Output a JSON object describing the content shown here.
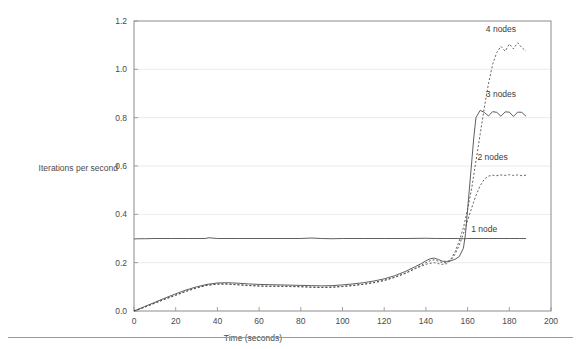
{
  "figure": {
    "width": 581,
    "height": 349,
    "background": "#ffffff",
    "footer_rule_color": "#9a9a9a"
  },
  "chart_data": {
    "type": "line",
    "title": "",
    "subtitle": "",
    "xlabel": "Time (seconds)",
    "ylabel": "Iterations per second",
    "xlim": [
      0,
      200
    ],
    "ylim": [
      0,
      1.2
    ],
    "xticks": [
      0,
      20,
      40,
      60,
      80,
      100,
      120,
      140,
      160,
      180,
      200
    ],
    "xtick_labels": [
      "0",
      "20",
      "40",
      "60",
      "80",
      "100",
      "120",
      "140",
      "160",
      "180",
      "200"
    ],
    "yticks": [
      0.0,
      0.2,
      0.4,
      0.6,
      0.8,
      1.0,
      1.2
    ],
    "ytick_labels": [
      "0.0",
      "0.2",
      "0.4",
      "0.6",
      "0.8",
      "1.0",
      "1.2"
    ],
    "grid": true,
    "grid_axis": "y",
    "grid_color": "#e6e6e6",
    "frame_color": "#8c8c8c",
    "legend_position": "inline-annotations",
    "line_color": "#4d4d4d",
    "annotations": [
      {
        "label": "4 nodes",
        "x": 176,
        "y": 1.155
      },
      {
        "label": "3 nodes",
        "x": 176,
        "y": 0.885
      },
      {
        "label": "2 nodes",
        "x": 172,
        "y": 0.625
      },
      {
        "label": "1 node",
        "x": 168,
        "y": 0.325
      }
    ],
    "series": [
      {
        "name": "1 node",
        "style": "solid",
        "dash": "none",
        "x": [
          0,
          2,
          5,
          10,
          18,
          26,
          34,
          36,
          40,
          50,
          60,
          70,
          80,
          85,
          90,
          95,
          100,
          110,
          120,
          130,
          140,
          145,
          150,
          155,
          158,
          160,
          165,
          170,
          175,
          180,
          185,
          188
        ],
        "y": [
          0.298,
          0.299,
          0.299,
          0.3,
          0.3,
          0.3,
          0.3,
          0.303,
          0.3,
          0.3,
          0.3,
          0.3,
          0.3,
          0.302,
          0.3,
          0.299,
          0.3,
          0.3,
          0.3,
          0.3,
          0.301,
          0.3,
          0.3,
          0.3,
          0.299,
          0.3,
          0.3,
          0.3,
          0.3,
          0.3,
          0.3,
          0.3
        ]
      },
      {
        "name": "2 nodes",
        "style": "dotted",
        "dash": "2,2",
        "x": [
          0,
          5,
          10,
          15,
          20,
          25,
          30,
          35,
          40,
          45,
          50,
          55,
          60,
          65,
          70,
          75,
          80,
          85,
          90,
          95,
          100,
          105,
          110,
          115,
          120,
          125,
          130,
          135,
          138,
          141,
          144,
          146,
          148,
          150,
          152,
          154,
          156,
          158,
          160,
          162,
          164,
          166,
          168,
          170,
          172,
          174,
          176,
          178,
          180,
          182,
          184,
          186,
          188
        ],
        "y": [
          0.0,
          0.016,
          0.033,
          0.05,
          0.066,
          0.082,
          0.096,
          0.107,
          0.112,
          0.112,
          0.109,
          0.106,
          0.104,
          0.103,
          0.103,
          0.102,
          0.101,
          0.099,
          0.098,
          0.099,
          0.102,
          0.106,
          0.111,
          0.118,
          0.127,
          0.14,
          0.155,
          0.175,
          0.186,
          0.196,
          0.2,
          0.196,
          0.193,
          0.196,
          0.21,
          0.235,
          0.272,
          0.32,
          0.374,
          0.428,
          0.478,
          0.518,
          0.545,
          0.558,
          0.562,
          0.56,
          0.563,
          0.561,
          0.564,
          0.561,
          0.563,
          0.56,
          0.562
        ]
      },
      {
        "name": "3 nodes",
        "style": "solid",
        "dash": "none",
        "x": [
          0,
          5,
          10,
          15,
          20,
          25,
          30,
          35,
          40,
          45,
          50,
          55,
          60,
          65,
          70,
          75,
          80,
          85,
          90,
          95,
          100,
          105,
          110,
          115,
          120,
          125,
          130,
          135,
          138,
          140,
          142,
          144,
          146,
          148,
          150,
          152,
          154,
          156,
          158,
          159,
          160,
          162,
          163,
          164,
          166,
          168,
          170,
          172,
          174,
          176,
          178,
          180,
          182,
          184,
          186,
          188
        ],
        "y": [
          0.0,
          0.018,
          0.036,
          0.054,
          0.071,
          0.087,
          0.1,
          0.11,
          0.116,
          0.117,
          0.115,
          0.112,
          0.11,
          0.109,
          0.108,
          0.107,
          0.106,
          0.105,
          0.104,
          0.105,
          0.108,
          0.112,
          0.117,
          0.124,
          0.133,
          0.146,
          0.163,
          0.184,
          0.197,
          0.208,
          0.216,
          0.219,
          0.213,
          0.206,
          0.205,
          0.208,
          0.214,
          0.225,
          0.26,
          0.32,
          0.42,
          0.62,
          0.72,
          0.8,
          0.83,
          0.822,
          0.807,
          0.825,
          0.822,
          0.806,
          0.824,
          0.823,
          0.805,
          0.823,
          0.822,
          0.806
        ]
      },
      {
        "name": "4 nodes",
        "style": "dotted",
        "dash": "2,2",
        "x": [
          0,
          5,
          10,
          15,
          20,
          25,
          30,
          35,
          40,
          45,
          50,
          55,
          60,
          65,
          70,
          75,
          80,
          85,
          90,
          95,
          100,
          105,
          110,
          115,
          120,
          125,
          130,
          135,
          138,
          140,
          142,
          144,
          146,
          148,
          150,
          152,
          154,
          156,
          158,
          160,
          162,
          164,
          166,
          168,
          170,
          172,
          174,
          176,
          178,
          180,
          182,
          184,
          186,
          188
        ],
        "y": [
          0.0,
          0.015,
          0.032,
          0.049,
          0.065,
          0.081,
          0.095,
          0.106,
          0.111,
          0.111,
          0.108,
          0.105,
          0.103,
          0.102,
          0.102,
          0.101,
          0.1,
          0.098,
          0.097,
          0.098,
          0.101,
          0.105,
          0.11,
          0.117,
          0.126,
          0.139,
          0.156,
          0.178,
          0.19,
          0.2,
          0.208,
          0.212,
          0.206,
          0.2,
          0.2,
          0.215,
          0.245,
          0.29,
          0.345,
          0.42,
          0.51,
          0.62,
          0.73,
          0.84,
          0.94,
          1.02,
          1.07,
          1.095,
          1.075,
          1.105,
          1.085,
          1.11,
          1.09,
          1.075
        ]
      }
    ]
  }
}
